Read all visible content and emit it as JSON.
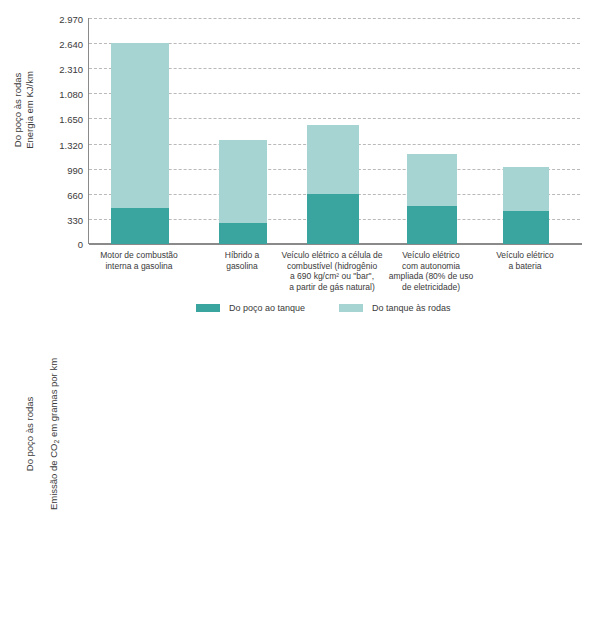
{
  "chart_data": [
    {
      "type": "bar",
      "id": "energy",
      "title": "",
      "ylabel": "Do poço às rodas\nEnergia em KJ/km",
      "xlabel": "",
      "ylim": [
        0,
        2970
      ],
      "grid": true,
      "stacked": true,
      "legend_position": "bottom",
      "yticks": [
        0,
        330,
        660,
        990,
        1320,
        1650,
        1080,
        2310,
        2640,
        2970
      ],
      "ytick_labels": [
        "0",
        "330",
        "660",
        "990",
        "1.320",
        "1.650",
        "1.080",
        "2.310",
        "2.640",
        "2.970"
      ],
      "categories": [
        "Motor de combustão\ninterna a gasolina",
        "Híbrido a\ngasolina",
        "Veículo elétrico a célula de\ncombustível (hidrogênio\na 690 kg/cm² ou \"bar\",\na partir de gás natural)",
        "Veículo elétrico\ncom autonomia\nampliada (80% de uso\nde eletricidade)",
        "Veículo elétrico\na bateria"
      ],
      "series": [
        {
          "name": "Do poço ao tanque",
          "color": "#3aa59f",
          "values": [
            470,
            280,
            660,
            500,
            430
          ]
        },
        {
          "name": "Do tanque às rodas",
          "color": "#a6d4d3",
          "values": [
            2170,
            1090,
            910,
            680,
            580
          ]
        }
      ],
      "totals": [
        2640,
        1370,
        1570,
        1180,
        1010
      ]
    },
    {
      "type": "bar",
      "id": "co2",
      "title": "",
      "ylabel": "Do poço às rodas\nEmissão de CO₂ em gramas por km",
      "xlabel": "",
      "ylim": [
        0,
        250
      ],
      "grid": true,
      "stacked": true,
      "legend_position": "bottom",
      "yticks": [
        0,
        30,
        60,
        95,
        125,
        155,
        190,
        220,
        250
      ],
      "ytick_labels": [
        "0",
        "30",
        "60",
        "95",
        "125",
        "155",
        "190",
        "220",
        "250"
      ],
      "categories": [
        "Motor de combustão\ninterna a gasolina",
        "Híbrido\na gasolina",
        "Veículo elétrico a célula\nde combustível (hidrogênio\na 690 kg/cm² ou \"bar\",\na partir de gás natural)",
        "Veículo elétrico\ncom autonomia\nampliada (80%\nde uso de eletricidade)",
        "Veículo elétrico\na bateria"
      ],
      "series": [
        {
          "name": "Do poço ao tanque",
          "color": "#3aa59f",
          "values": [
            30,
            20,
            88,
            57,
            52
          ]
        },
        {
          "name": "Do tanque às rodas",
          "color": "#a6d4d3",
          "values": [
            140,
            93,
            0,
            8,
            0
          ]
        }
      ],
      "totals": [
        170,
        113,
        88,
        65,
        52
      ]
    }
  ],
  "top": {
    "ytitle": "Do poço às rodas\nEnergia em KJ/km",
    "yticks": [
      "2.970",
      "2.640",
      "2.310",
      "1.080",
      "1.650",
      "1.320",
      "990",
      "660",
      "330",
      "0"
    ],
    "xlabels": [
      "Motor de combustão\ninterna a gasolina",
      "Híbrido a\ngasolina",
      "Veículo elétrico a célula de\ncombustível (hidrogênio\na 690 kg/cm² ou \"bar\",\na partir de gás natural)",
      "Veículo elétrico\ncom autonomia\nampliada (80% de uso\nde eletricidade)",
      "Veículo elétrico\na bateria"
    ],
    "legend": [
      {
        "label": "Do poço ao tanque",
        "color": "#3aa59f"
      },
      {
        "label": "Do tanque às rodas",
        "color": "#a6d4d3"
      }
    ]
  },
  "bottom": {
    "ytitle_line1": "Do poço às rodas",
    "ytitle_line2_pre": "Emissão de CO",
    "ytitle_line2_sub": "2",
    "ytitle_line2_post": " em gramas por km",
    "yticks": [
      "250",
      "220",
      "190",
      "155",
      "125",
      "95",
      "60",
      "30",
      "0"
    ],
    "xlabels": [
      "Motor de combustão\ninterna a gasolina",
      "Híbrido\na gasolina",
      "Veículo elétrico a célula\nde combustível (hidrogênio\na 690 kg/cm² ou \"bar\",\na partir de gás natural)",
      "Veículo elétrico\ncom autonomia\nampliada (80%\nde uso de eletricidade)",
      "Veículo elétrico\na bateria"
    ],
    "legend": [
      {
        "label": "Do poço ao tanque",
        "color": "#3aa59f"
      },
      {
        "label": "Do tanque às rodas",
        "color": "#a6d4d3"
      }
    ]
  },
  "colors": {
    "dark_teal": "#3aa59f",
    "light_teal": "#a6d4d3",
    "gridline": "#b9b9b9",
    "axis": "#8a8a8a",
    "text": "#3a3a3a"
  }
}
